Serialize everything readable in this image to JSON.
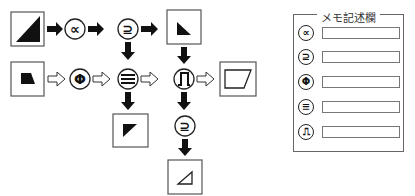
{
  "diagram": {
    "symbols": {
      "proportional": "∝",
      "superset_eq": "⊇",
      "phi": "Φ",
      "identical": "≡",
      "pulse": "⎍"
    },
    "nodes": [
      {
        "id": "start-top",
        "type": "box",
        "shape": "black-right-triangle-large"
      },
      {
        "id": "op-proportional",
        "type": "symbol",
        "symbol": "∝"
      },
      {
        "id": "op-superset-1",
        "type": "symbol",
        "symbol": "⊇"
      },
      {
        "id": "result-top-right",
        "type": "box",
        "shape": "black-small-triangle-bottom-left"
      },
      {
        "id": "start-left",
        "type": "box",
        "shape": "black-trapezoid"
      },
      {
        "id": "op-phi",
        "type": "symbol",
        "symbol": "Φ"
      },
      {
        "id": "op-identical",
        "type": "symbol",
        "symbol": "≡"
      },
      {
        "id": "op-pulse",
        "type": "symbol",
        "symbol": "⎍"
      },
      {
        "id": "result-right",
        "type": "box",
        "shape": "outline-parallelogram"
      },
      {
        "id": "result-below-identical",
        "type": "box",
        "shape": "black-triangle-top-left"
      },
      {
        "id": "op-superset-2",
        "type": "symbol",
        "symbol": "⊇"
      },
      {
        "id": "result-bottom",
        "type": "box",
        "shape": "outline-small-triangle"
      }
    ],
    "edges": [
      {
        "from": "start-top",
        "to": "op-proportional",
        "style": "solid"
      },
      {
        "from": "op-proportional",
        "to": "op-superset-1",
        "style": "solid"
      },
      {
        "from": "op-superset-1",
        "to": "result-top-right",
        "style": "solid"
      },
      {
        "from": "op-superset-1",
        "to": "op-identical",
        "style": "solid"
      },
      {
        "from": "result-top-right",
        "to": "op-pulse",
        "style": "solid"
      },
      {
        "from": "start-left",
        "to": "op-phi",
        "style": "hollow"
      },
      {
        "from": "op-phi",
        "to": "op-identical",
        "style": "hollow"
      },
      {
        "from": "op-identical",
        "to": "op-pulse",
        "style": "hollow"
      },
      {
        "from": "op-pulse",
        "to": "result-right",
        "style": "hollow"
      },
      {
        "from": "op-identical",
        "to": "result-below-identical",
        "style": "solid"
      },
      {
        "from": "op-pulse",
        "to": "op-superset-2",
        "style": "solid"
      },
      {
        "from": "op-superset-2",
        "to": "result-bottom",
        "style": "solid"
      }
    ]
  },
  "memo": {
    "title": "メモ記述欄",
    "rows": [
      {
        "symbol": "∝",
        "value": ""
      },
      {
        "symbol": "⊇",
        "value": ""
      },
      {
        "symbol": "Φ",
        "value": ""
      },
      {
        "symbol": "≡",
        "value": ""
      },
      {
        "symbol": "⎍",
        "value": ""
      }
    ]
  }
}
